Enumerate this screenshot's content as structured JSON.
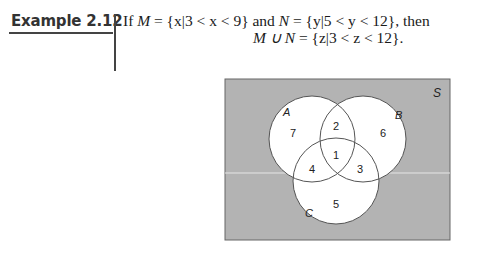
{
  "example": {
    "label": "Example 2.12",
    "line1": {
      "prefix": "If ",
      "M": "M",
      "M_def": " = {x|3 < x < 9} and ",
      "N": "N",
      "N_def": " = {y|5 < y < 12}, then"
    },
    "line2": {
      "lhs": "M ∪ N",
      "rhs": " = {z|3 < z < 12}."
    }
  },
  "figure": {
    "universe_label": "S",
    "background_color": "#b3b3b3",
    "circle_fill": "#ffffff",
    "circles": [
      {
        "name": "A",
        "label": "A"
      },
      {
        "name": "B",
        "label": "B"
      },
      {
        "name": "C",
        "label": "C"
      }
    ],
    "regions": [
      {
        "id": "A_only",
        "label": "7"
      },
      {
        "id": "A_and_B_only",
        "label": "2"
      },
      {
        "id": "B_only",
        "label": "6"
      },
      {
        "id": "A_and_B_and_C",
        "label": "1"
      },
      {
        "id": "A_and_C_only",
        "label": "4"
      },
      {
        "id": "B_and_C_only",
        "label": "3"
      },
      {
        "id": "C_only",
        "label": "5"
      }
    ]
  }
}
